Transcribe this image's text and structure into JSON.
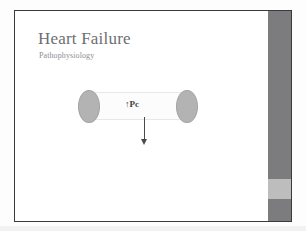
{
  "slide": {
    "title": "Heart Failure",
    "subtitle": "Pathophysiology",
    "background_color": "#ffffff",
    "border_color": "#3a3a3c",
    "title_color": "#6e6e72",
    "subtitle_color": "#8d8d90"
  },
  "side_band": {
    "name": "decorative-right-band",
    "primary_color": "#7c7c7e",
    "accent_color": "#bdbdbd"
  },
  "diagram": {
    "name": "capillary-hydrostatic-pressure-diagram",
    "label": "↑Pc",
    "label_color": "#3d3d3f",
    "cell_fill": "#b3b3b3",
    "cell_stroke": "#a4a4a4",
    "vessel_wall_color": "#e8e8e8",
    "arrow_color": "#4a4a4c",
    "arrow_direction": "down",
    "cells": [
      {
        "name": "capillary-cell-left",
        "position": "left"
      },
      {
        "name": "capillary-cell-right",
        "position": "right"
      }
    ]
  }
}
